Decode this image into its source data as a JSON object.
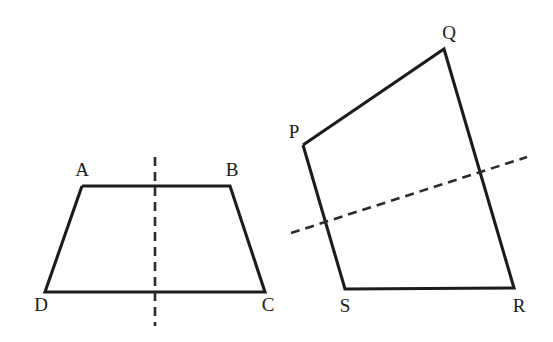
{
  "figure": {
    "background_color": "#ffffff",
    "stroke_color": "#1c1c1c",
    "dash_color": "#2b2b2b",
    "label_color": "#1a1a1a",
    "width": 553,
    "height": 342
  },
  "shapes": [
    {
      "id": "trapezoid-abcd",
      "name": "trapezoid ABCD",
      "outline_points": "82,186 230,186 265,292 45,292 82,186",
      "vertices": [
        {
          "label": "A",
          "x": 82,
          "y": 186,
          "label_x": 82,
          "label_y": 176
        },
        {
          "label": "B",
          "x": 230,
          "y": 186,
          "label_x": 232,
          "label_y": 176
        },
        {
          "label": "C",
          "x": 265,
          "y": 292,
          "label_x": 268,
          "label_y": 311
        },
        {
          "label": "D",
          "x": 45,
          "y": 292,
          "label_x": 41,
          "label_y": 311
        }
      ],
      "dashed_line": {
        "name": "vertical line of symmetry",
        "x1": 155,
        "y1": 157,
        "x2": 155,
        "y2": 326,
        "dash_pattern": "9 6"
      }
    },
    {
      "id": "quadrilateral-pqrs",
      "name": "quadrilateral PQRS",
      "outline_points": "303,145 444,49 514,288 345,289 303,145",
      "vertices": [
        {
          "label": "P",
          "x": 303,
          "y": 145,
          "label_x": 294,
          "label_y": 138
        },
        {
          "label": "Q",
          "x": 444,
          "y": 49,
          "label_x": 449,
          "label_y": 39
        },
        {
          "label": "R",
          "x": 514,
          "y": 288,
          "label_x": 519,
          "label_y": 312
        },
        {
          "label": "S",
          "x": 345,
          "y": 289,
          "label_x": 345,
          "label_y": 312
        }
      ],
      "dashed_line": {
        "name": "slanted dashed line",
        "x1": 291,
        "y1": 233,
        "x2": 527,
        "y2": 157,
        "dash_pattern": "9 6"
      }
    }
  ]
}
